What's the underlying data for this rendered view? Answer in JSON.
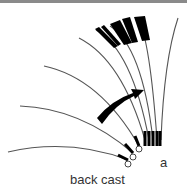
{
  "figure": {
    "panel_label": "a",
    "caption": "back cast",
    "rod_positions": 8,
    "arrow": "curved-arrow-rearward",
    "colors": {
      "rod": "#555555",
      "handle": "#000000",
      "line_border": "#8a8a8a"
    }
  }
}
